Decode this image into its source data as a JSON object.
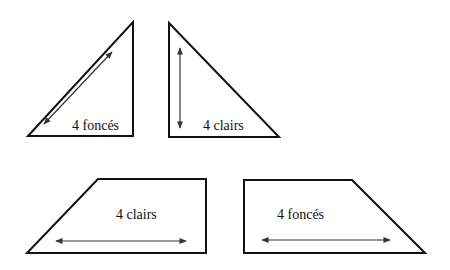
{
  "diagram": {
    "shapes": [
      {
        "id": "triangle-left",
        "type": "right-triangle",
        "label": "4 foncés",
        "arrow": "diagonal"
      },
      {
        "id": "triangle-right",
        "type": "right-triangle",
        "label": "4 clairs",
        "arrow": "vertical"
      },
      {
        "id": "trapezoid-left",
        "type": "trapezoid",
        "label": "4 clairs",
        "arrow": "horizontal"
      },
      {
        "id": "trapezoid-right",
        "type": "trapezoid",
        "label": "4 foncés",
        "arrow": "horizontal"
      }
    ],
    "colors": {
      "stroke": "#111111",
      "arrow": "#333333",
      "background": "#ffffff"
    }
  }
}
